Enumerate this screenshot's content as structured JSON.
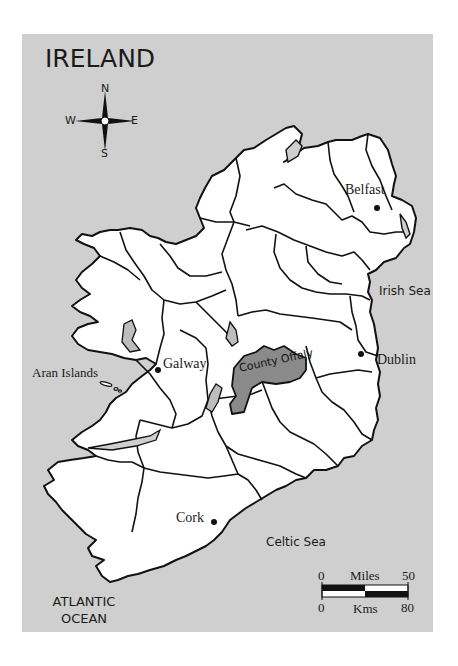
{
  "title": "IRELAND",
  "colors": {
    "sea": "#cfcfcf",
    "land": "#ffffff",
    "highlight": "#8a8a8a",
    "lake": "#bdbdbd",
    "outline": "#111111"
  },
  "compass": {
    "n": "N",
    "s": "S",
    "e": "E",
    "w": "W"
  },
  "highlighted_county": "County Offaly",
  "cities": [
    {
      "name": "Belfast"
    },
    {
      "name": "Dublin"
    },
    {
      "name": "Galway"
    },
    {
      "name": "Cork"
    }
  ],
  "places": {
    "aran": "Aran Islands"
  },
  "seas": {
    "irish": "Irish Sea",
    "celtic": "Celtic Sea"
  },
  "ocean": {
    "line1": "ATLANTIC",
    "line2": "OCEAN"
  },
  "scale": {
    "miles_label": "Miles",
    "miles_start": "0",
    "miles_end": "50",
    "kms_label": "Kms",
    "kms_start": "0",
    "kms_end": "80"
  }
}
